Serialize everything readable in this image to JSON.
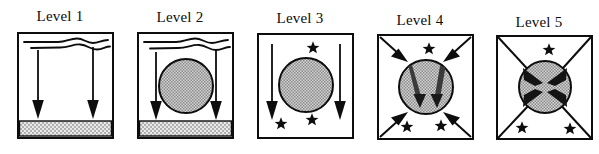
{
  "figure": {
    "title": "",
    "type": "scientific-diagram",
    "background_color": "#ffffff",
    "ink_color": "#0d0d0d",
    "fill_gray": "#a8a8a8",
    "hatch_gray": "#cfcfcf",
    "panel_count": 5
  },
  "panels": [
    {
      "id": "level-1",
      "label": "Level 1",
      "label_x": 22,
      "x": 18,
      "box": {
        "x": 18,
        "y": 33,
        "w": 95,
        "h": 105
      },
      "has_waves": true,
      "wave_count": 2,
      "has_circle": false,
      "has_bed": true,
      "down_arrows": 2,
      "diagonal_arrows": 0,
      "stars": 0,
      "has_diagonals": false,
      "wedges": 0
    },
    {
      "id": "level-2",
      "label": "Level 2",
      "label_x": 140,
      "x": 138,
      "box": {
        "x": 138,
        "y": 33,
        "w": 95,
        "h": 105
      },
      "has_waves": true,
      "wave_count": 2,
      "has_circle": true,
      "has_bed": true,
      "down_arrows": 2,
      "diagonal_arrows": 0,
      "stars": 0,
      "has_diagonals": false,
      "wedges": 0
    },
    {
      "id": "level-3",
      "label": "Level 3",
      "label_x": 260,
      "x": 258,
      "box": {
        "x": 258,
        "y": 34,
        "w": 95,
        "h": 104
      },
      "has_waves": false,
      "wave_count": 0,
      "has_circle": true,
      "has_bed": false,
      "down_arrows": 2,
      "diagonal_arrows": 0,
      "stars": 3,
      "has_diagonals": false,
      "wedges": 0
    },
    {
      "id": "level-4",
      "label": "Level 4",
      "label_x": 380,
      "x": 378,
      "box": {
        "x": 378,
        "y": 35,
        "w": 95,
        "h": 104
      },
      "has_waves": false,
      "wave_count": 0,
      "has_circle": true,
      "has_bed": false,
      "down_arrows": 0,
      "diagonal_arrows": 4,
      "stars": 3,
      "has_diagonals": false,
      "wedges": 2
    },
    {
      "id": "level-5",
      "label": "Level 5",
      "label_x": 498,
      "x": 496,
      "box": {
        "x": 496,
        "y": 36,
        "w": 95,
        "h": 103
      },
      "has_waves": false,
      "wave_count": 0,
      "has_circle": true,
      "has_bed": false,
      "down_arrows": 0,
      "diagonal_arrows": 0,
      "stars": 3,
      "has_diagonals": true,
      "wedges": 4
    }
  ],
  "labels": {
    "level_1": "Level 1",
    "level_2": "Level 2",
    "level_3": "Level 3",
    "level_4": "Level 4",
    "level_5": "Level 5"
  }
}
